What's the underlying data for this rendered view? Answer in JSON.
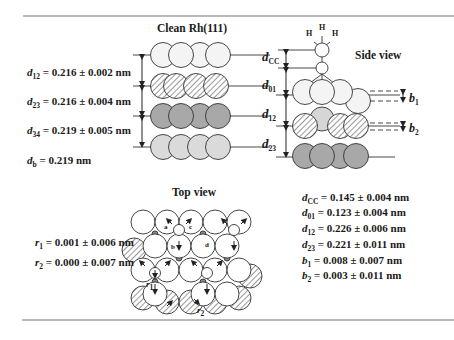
{
  "figure": {
    "clean_title": "Clean Rh(111)",
    "side_title": "Side view",
    "top_title": "Top view",
    "clean_params": [
      {
        "sym": "d",
        "sub": "12",
        "text": "= 0.216 ± 0.002 nm"
      },
      {
        "sym": "d",
        "sub": "23",
        "text": "= 0.216 ± 0.004 nm"
      },
      {
        "sym": "d",
        "sub": "34",
        "text": "= 0.219 ± 0.005 nm"
      },
      {
        "sym": "d",
        "sub": "b",
        "text": " = 0.219 nm"
      }
    ],
    "side_labels": [
      {
        "sym": "d",
        "sub": "CC"
      },
      {
        "sym": "d",
        "sub": "01"
      },
      {
        "sym": "d",
        "sub": "12"
      },
      {
        "sym": "d",
        "sub": "23"
      }
    ],
    "buckle_labels": [
      {
        "sym": "b",
        "sub": "1"
      },
      {
        "sym": "b",
        "sub": "2"
      }
    ],
    "atom_labels": {
      "H": "H"
    },
    "top_view_site_labels": [
      "a",
      "b",
      "c",
      "d"
    ],
    "top_view_r_labels": [
      {
        "sym": "r",
        "sub": "1"
      },
      {
        "sym": "r",
        "sub": "2"
      }
    ],
    "lateral_params": [
      {
        "sym": "r",
        "sub": "1",
        "text": "= 0.001 ± 0.006 nm"
      },
      {
        "sym": "r",
        "sub": "2",
        "text": "= 0.000 ± 0.007 nm"
      }
    ],
    "adsorbate_params": [
      {
        "sym": "d",
        "sub": "CC",
        "text": "= 0.145 ± 0.004 nm"
      },
      {
        "sym": "d",
        "sub": "01",
        "text": "= 0.123 ± 0.004 nm"
      },
      {
        "sym": "d",
        "sub": "12",
        "text": "= 0.226 ± 0.006 nm"
      },
      {
        "sym": "d",
        "sub": "23",
        "text": "= 0.221 ± 0.011 nm"
      },
      {
        "sym": "b",
        "sub": "1",
        "text": " = 0.008 ± 0.007 nm"
      },
      {
        "sym": "b",
        "sub": "2",
        "text": " = 0.003 ± 0.011 nm"
      }
    ],
    "colors": {
      "layer1": "#f2f2f2",
      "layer2_hatch": "#ffffff",
      "layer3": "#a9a9a9",
      "layer4": "#d9d9d9",
      "stroke": "#333333",
      "rule": "#777777"
    }
  }
}
